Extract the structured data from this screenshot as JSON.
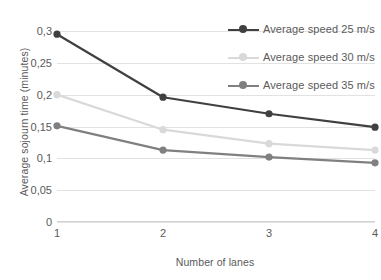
{
  "chart_data": {
    "type": "line",
    "title": "",
    "xlabel": "Number of lanes",
    "ylabel": "Average sojourn time (minutes)",
    "x": [
      1,
      2,
      3,
      4
    ],
    "x_tick_labels": [
      "1",
      "2",
      "3",
      "4"
    ],
    "y_tick_labels": [
      "0",
      "0,05",
      "0,1",
      "0,15",
      "0,2",
      "0,25",
      "0,3"
    ],
    "y_ticks": [
      0,
      0.05,
      0.1,
      0.15,
      0.2,
      0.25,
      0.3
    ],
    "ylim": [
      0,
      0.3
    ],
    "xlim": [
      1,
      4
    ],
    "grid": "horizontal",
    "legend_position": "top-right",
    "decimal_separator": ",",
    "series": [
      {
        "name": "Average speed 25 m/s",
        "color": "#404040",
        "values": [
          0.295,
          0.196,
          0.17,
          0.149
        ]
      },
      {
        "name": "Average speed 30 m/s",
        "color": "#d9d9d9",
        "values": [
          0.2,
          0.145,
          0.123,
          0.113
        ]
      },
      {
        "name": "Average speed 35 m/s",
        "color": "#808080",
        "values": [
          0.151,
          0.113,
          0.102,
          0.093
        ]
      }
    ]
  },
  "legend": {
    "items": [
      {
        "label": "Average speed 25 m/s"
      },
      {
        "label": "Average speed 30 m/s"
      },
      {
        "label": "Average speed 35 m/s"
      }
    ]
  }
}
